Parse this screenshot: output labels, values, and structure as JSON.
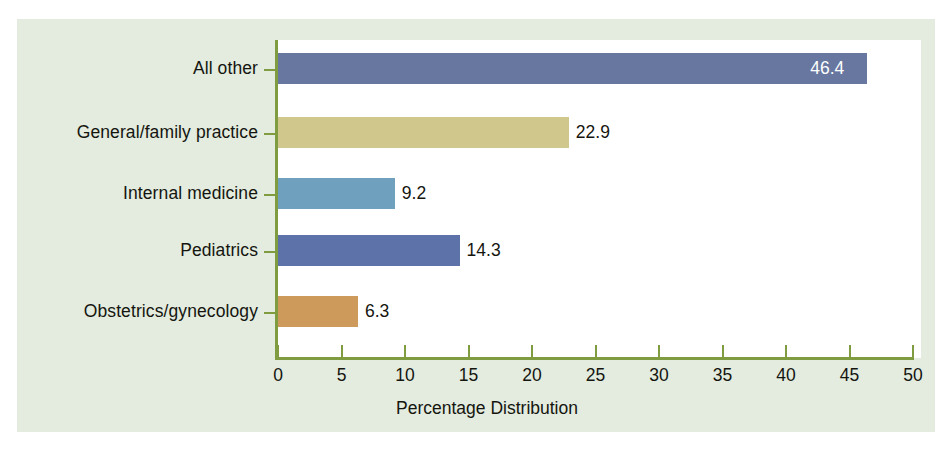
{
  "chart_data": {
    "type": "bar",
    "orientation": "horizontal",
    "title": "",
    "subtitle": "",
    "xlabel": "Percentage Distribution",
    "ylabel": "",
    "categories": [
      "All other",
      "General/family practice",
      "Internal medicine",
      "Pediatrics",
      "Obstetrics/gynecology"
    ],
    "values": [
      46.4,
      22.9,
      9.2,
      14.3,
      6.3
    ],
    "value_labels": [
      "46.4",
      "22.9",
      "9.2",
      "14.3",
      "6.3"
    ],
    "bar_colors": [
      "#67779f",
      "#cfc78c",
      "#6fa0be",
      "#5d72a8",
      "#ce9a5c"
    ],
    "label_placement": [
      "inside",
      "outside",
      "outside",
      "outside",
      "outside"
    ],
    "xlim": [
      0,
      50
    ],
    "xticks": [
      0,
      5,
      10,
      15,
      20,
      25,
      30,
      35,
      40,
      45,
      50
    ],
    "xtick_labels": [
      "0",
      "5",
      "10",
      "15",
      "20",
      "25",
      "30",
      "35",
      "40",
      "45",
      "50"
    ],
    "grid": false,
    "legend": false,
    "legend_position": "none"
  },
  "style": {
    "panel_background": "#e3ecdf",
    "plot_background": "#ffffff",
    "axis_color": "#7f9c41",
    "text_color": "#15150f",
    "inside_label_color": "#ffffff"
  }
}
